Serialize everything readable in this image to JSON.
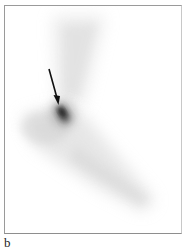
{
  "figure": {
    "panel_label": "b",
    "image": {
      "type": "scintigraphy",
      "description": "Grayscale nuclear medicine scan of a foot/ankle region with a focal area of increased uptake",
      "annotations": [
        {
          "type": "arrow",
          "direction": "down-right",
          "points_to": "focal-hot-spot"
        }
      ]
    },
    "colors": {
      "background": "#ffffff",
      "frame_border": "#9a9a9a",
      "uptake_dark": "#1a1a1a",
      "arrow": "#111111"
    }
  }
}
